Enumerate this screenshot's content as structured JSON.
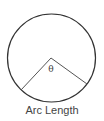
{
  "diagram": {
    "caption": "Arc Length",
    "angle_label": "θ",
    "stroke_color": "#333333",
    "circle": {
      "cx": 51.5,
      "cy": 58,
      "r": 44
    },
    "radius_ends": [
      [
        21,
        90
      ],
      [
        87,
        84
      ]
    ]
  }
}
